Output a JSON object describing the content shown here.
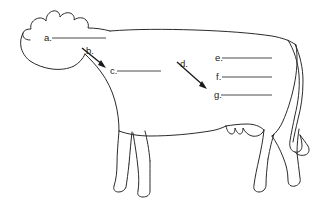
{
  "worksheet": {
    "title": "Cow Anatomy Labeling Diagram",
    "subject_icon": "cow-outline-icon",
    "background_color": "#ffffff",
    "outline_color": "#2b2b2b",
    "line_color": "#4a4a4a",
    "arrow_color": "#1a1a1a",
    "width": 325,
    "height": 206
  },
  "labels": [
    {
      "id": "a",
      "text": "a.",
      "answer": "",
      "marker_type": "blank-line",
      "text_x": 44,
      "text_y": 40,
      "line_x1": 52,
      "line_x2": 106,
      "line_y": 38
    },
    {
      "id": "b",
      "text": "b.",
      "answer": "",
      "marker_type": "arrow",
      "text_x": 86,
      "text_y": 53,
      "arrow_x1": 82,
      "arrow_y1": 48,
      "arrow_x2": 106,
      "arrow_y2": 68
    },
    {
      "id": "c",
      "text": "c.",
      "answer": "",
      "marker_type": "blank-line",
      "text_x": 110,
      "text_y": 73,
      "line_x1": 117,
      "line_x2": 161,
      "line_y": 71
    },
    {
      "id": "d",
      "text": "d.",
      "answer": "",
      "marker_type": "arrow",
      "text_x": 180,
      "text_y": 66,
      "arrow_x1": 177,
      "arrow_y1": 62,
      "arrow_x2": 207,
      "arrow_y2": 89
    },
    {
      "id": "e",
      "text": "e.",
      "answer": "",
      "marker_type": "blank-line",
      "text_x": 215,
      "text_y": 60,
      "line_x1": 222,
      "line_x2": 272,
      "line_y": 58
    },
    {
      "id": "f",
      "text": "f.",
      "answer": "",
      "marker_type": "blank-line",
      "text_x": 216,
      "text_y": 79,
      "line_x1": 222,
      "line_x2": 272,
      "line_y": 77
    },
    {
      "id": "g",
      "text": "g.",
      "answer": "",
      "marker_type": "blank-line",
      "text_x": 214,
      "text_y": 97,
      "line_x1": 221,
      "line_x2": 272,
      "line_y": 95
    }
  ],
  "figure": {
    "name": "cow",
    "body_path": "M 26 36 C 24 31 28 27 34 26 C 36 20 42 16 48 16 C 50 12 54 9 58 10 C 61 11 62 14 62 17 C 65 15 69 14 72 16 C 73 13 77 11 80 13 C 83 15 82 19 80 21 C 86 20 92 21 95 25 C 110 24 130 25 150 26 C 180 27 215 28 248 30 C 268 31 282 34 291 39 C 296 42 299 46 300 50",
    "belly_path": "M 95 25 C 94 32 93 40 93 46 C 93 52 91 58 86 62 C 78 68 68 70 58 70 C 48 70 38 68 31 63 C 26 59 25 52 26 45 C 23 43 22 40 24 38 C 25 37 26 36 26 36",
    "neck_path": "M 93 46 C 98 53 103 60 108 68 C 113 76 117 85 119 96 C 121 108 121 118 120 127",
    "underline_path": "M 120 127 C 127 130 136 131 146 131 C 165 131 186 130 203 128 C 211 127 218 126 223 124",
    "rear_path": "M 223 124 C 230 123 236 122 241 121 C 247 120 252 120 256 121",
    "hind_upper": "M 300 50 C 301 62 300 76 297 90 C 294 104 290 116 286 125",
    "tail_outer": "M 291 39 C 296 48 299 60 300 72 C 301 86 299 100 296 113 C 294 124 291 134 289 142 C 288 148 289 152 292 154 C 295 156 299 155 301 152 C 303 149 303 145 302 141",
    "tail_inner": "M 296 42 C 300 52 302 64 302 76 C 302 90 300 104 297 116 C 295 126 293 135 292 141",
    "legs": [
      "M 120 127 C 119 139 118 152 118 163 C 118 172 117 180 116 187 C 115 191 117 193 120 193 C 124 193 127 191 128 188 C 129 183 129 176 130 168",
      "M 130 168 C 131 156 132 143 133 131",
      "M 133 131 C 136 142 138 154 139 166 C 140 175 140 183 139 190 C 138 194 140 196 144 196 C 148 196 151 194 151 190 C 151 181 151 170 151 160"
    ],
    "udder": "M 223 124 C 224 130 226 134 230 136 C 234 138 239 138 243 136 C 247 134 249 130 250 125"
  }
}
